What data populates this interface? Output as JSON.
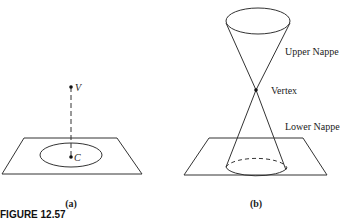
{
  "figure": {
    "caption": "FIGURE 12.57",
    "panels": [
      {
        "id": "a",
        "label": "(a)",
        "points": {
          "vertex": "V",
          "center": "C"
        }
      },
      {
        "id": "b",
        "label": "(b)",
        "annotations": {
          "upper": "Upper Nappe",
          "vertex": "Vertex",
          "lower": "Lower Nappe"
        }
      }
    ]
  }
}
